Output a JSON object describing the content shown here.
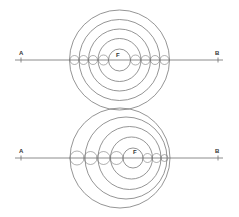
{
  "colors": {
    "stroke": "#7a7a7a",
    "line": "#6e6e6e",
    "label": "#333333",
    "background": "#ffffff"
  },
  "panels": [
    {
      "name": "concentric-circles",
      "line": {
        "y": 60,
        "x1": 15,
        "x2": 223
      },
      "labels": [
        {
          "text": "A",
          "x": 19,
          "y": 55,
          "tick_x": 21
        },
        {
          "text": "B",
          "x": 215,
          "y": 55,
          "tick_x": 218
        },
        {
          "text": "F",
          "x": 116,
          "y": 57
        }
      ],
      "rings": [
        {
          "cx": 119.5,
          "cy": 60,
          "r": 50
        },
        {
          "cx": 119.5,
          "cy": 60,
          "r": 40.5
        },
        {
          "cx": 119.5,
          "cy": 60,
          "r": 31
        },
        {
          "cx": 119.5,
          "cy": 60,
          "r": 21.5
        },
        {
          "cx": 119.5,
          "cy": 60,
          "r": 11
        }
      ],
      "bumps": [
        {
          "cx": 74.5,
          "r": 4.5
        },
        {
          "cx": 83.5,
          "r": 4.5
        },
        {
          "cx": 93,
          "r": 4.5
        },
        {
          "cx": 103.5,
          "r": 5
        },
        {
          "cx": 135.5,
          "r": 5
        },
        {
          "cx": 145.5,
          "r": 4.5
        },
        {
          "cx": 155,
          "r": 4.5
        },
        {
          "cx": 164.5,
          "r": 4.5
        }
      ]
    },
    {
      "name": "eccentric-circles",
      "line": {
        "y": 158,
        "x1": 15,
        "x2": 223
      },
      "labels": [
        {
          "text": "A",
          "x": 19,
          "y": 153,
          "tick_x": 21
        },
        {
          "text": "B",
          "x": 215,
          "y": 153,
          "tick_x": 218
        },
        {
          "text": "F",
          "x": 133,
          "y": 154
        }
      ],
      "rings": [
        {
          "cx": 120,
          "cy": 158,
          "r": 50
        },
        {
          "cx": 126,
          "cy": 158,
          "r": 41
        },
        {
          "cx": 129.5,
          "cy": 158,
          "r": 31.5
        },
        {
          "cx": 131.5,
          "cy": 158,
          "r": 21
        },
        {
          "cx": 133,
          "cy": 158,
          "r": 10
        }
      ],
      "bumps": [
        {
          "cx": 77,
          "r": 7
        },
        {
          "cx": 90.5,
          "r": 6.5
        },
        {
          "cx": 103.5,
          "r": 6.5
        },
        {
          "cx": 116.5,
          "r": 6.5
        },
        {
          "cx": 147.5,
          "r": 4.5
        },
        {
          "cx": 156.5,
          "r": 4.5
        },
        {
          "cx": 164.5,
          "r": 3.5
        }
      ]
    }
  ]
}
